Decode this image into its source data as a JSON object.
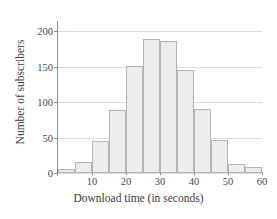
{
  "chart_data": {
    "type": "bar",
    "title": "",
    "xlabel": "Download time (in seconds)",
    "ylabel": "Number of subscribers",
    "categories": [
      "0-5",
      "5-10",
      "10-15",
      "15-20",
      "20-25",
      "25-30",
      "30-35",
      "35-40",
      "40-45",
      "45-50",
      "50-55",
      "55-60"
    ],
    "bin_edges": [
      0,
      5,
      10,
      15,
      20,
      25,
      30,
      35,
      40,
      45,
      50,
      55,
      60
    ],
    "values": [
      5,
      15,
      45,
      89,
      151,
      189,
      186,
      145,
      90,
      46,
      13,
      9
    ],
    "xlim": [
      0,
      60
    ],
    "ylim": [
      0,
      210
    ],
    "x_ticks": [
      10,
      20,
      30,
      40,
      50,
      60
    ],
    "x_tick_labels": [
      "10",
      "20",
      "30",
      "40",
      "50",
      "60"
    ],
    "y_ticks": [
      0,
      50,
      100,
      150,
      200
    ],
    "y_tick_labels": [
      "0",
      "50",
      "100",
      "150",
      "200"
    ],
    "grid": "horizontal",
    "legend": "none",
    "bar_fill_color": "#ececec",
    "bar_edge_color": "#b4b4b4",
    "grid_color": "#dcdcdc",
    "axis_color": "#8c8c8c"
  }
}
